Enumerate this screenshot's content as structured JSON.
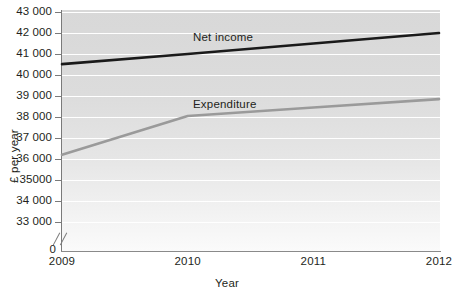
{
  "chart_data": {
    "type": "line",
    "title": "",
    "xlabel": "Year",
    "ylabel": "£ per year",
    "x": [
      2009,
      2010,
      2011,
      2012
    ],
    "xtick_labels": [
      "2009",
      "2010",
      "2011",
      "2012"
    ],
    "ytick_labels": [
      "43 000",
      "42 000",
      "41 000",
      "40 000",
      "39 000",
      "38 000",
      "37 000",
      "36 000",
      "35000",
      "34 000",
      "33 000"
    ],
    "ytick_values": [
      43000,
      42000,
      41000,
      40000,
      39000,
      38000,
      37000,
      36000,
      35000,
      34000,
      33000
    ],
    "ylim": [
      33000,
      43000
    ],
    "origin_label": "0",
    "axis_break": true,
    "grid": true,
    "legend_position": "inline-labels",
    "series": [
      {
        "name": "Net income",
        "color": "#1a1a1a",
        "values": [
          40520,
          41000,
          41500,
          42000
        ]
      },
      {
        "name": "Expenditure",
        "color": "#9a9a9a",
        "values": [
          36200,
          38050,
          38450,
          38850
        ]
      }
    ]
  },
  "axis_titles": {
    "y": "£ per year",
    "x": "Year"
  },
  "zero": "0"
}
